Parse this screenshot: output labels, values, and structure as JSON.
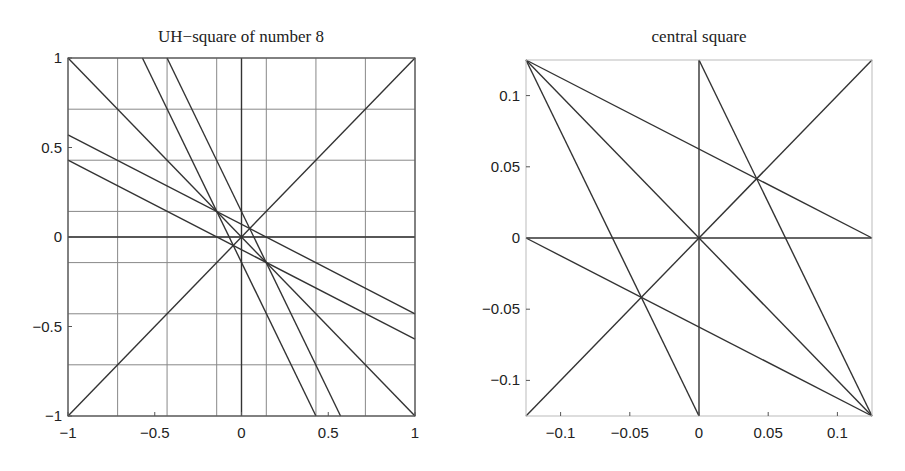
{
  "chart_data": [
    {
      "type": "line",
      "title": "UH−square of number 8",
      "xlabel": "",
      "ylabel": "",
      "xlim": [
        -1,
        1
      ],
      "ylim": [
        -1,
        1
      ],
      "grid": true,
      "grid_values": [
        -1,
        -0.714,
        -0.429,
        -0.143,
        0,
        0.143,
        0.429,
        0.714,
        1
      ],
      "xticks": [
        -1,
        -0.5,
        0,
        0.5,
        1
      ],
      "xtick_labels": [
        "−1",
        "−0.5",
        "0",
        "0.5",
        "1"
      ],
      "yticks": [
        1,
        0.5,
        0,
        -0.5,
        -1
      ],
      "ytick_labels": [
        "1",
        "0.5",
        "0",
        "−0.5",
        "−1"
      ],
      "series": [
        {
          "name": "diagonal y=x",
          "x": [
            -1,
            1
          ],
          "y": [
            -1,
            1
          ]
        },
        {
          "name": "anti-diagonal y=-x",
          "x": [
            -1,
            1
          ],
          "y": [
            1,
            -1
          ]
        },
        {
          "name": "horizontal y=0",
          "x": [
            -1,
            1
          ],
          "y": [
            0,
            0
          ]
        },
        {
          "name": "vertical x=0",
          "x": [
            0,
            0
          ],
          "y": [
            -1,
            1
          ]
        },
        {
          "name": "shallow upper",
          "x": [
            -1,
            1
          ],
          "y": [
            0.571,
            -0.429
          ]
        },
        {
          "name": "shallow lower",
          "x": [
            -1,
            1
          ],
          "y": [
            0.429,
            -0.571
          ]
        },
        {
          "name": "steep left",
          "x": [
            -0.571,
            0.429
          ],
          "y": [
            1,
            -1
          ]
        },
        {
          "name": "steep right",
          "x": [
            -0.429,
            0.571
          ],
          "y": [
            1,
            -1
          ]
        }
      ]
    },
    {
      "type": "line",
      "title": "central square",
      "xlabel": "",
      "ylabel": "",
      "xlim": [
        -0.125,
        0.125
      ],
      "ylim": [
        -0.125,
        0.125
      ],
      "grid": false,
      "xticks": [
        -0.1,
        -0.05,
        0,
        0.05,
        0.1
      ],
      "xtick_labels": [
        "−0.1",
        "−0.05",
        "0",
        "0.05",
        "0.1"
      ],
      "yticks": [
        0.1,
        0.05,
        0,
        -0.05,
        -0.1
      ],
      "ytick_labels": [
        "0.1",
        "0.05",
        "0",
        "−0.05",
        "−0.1"
      ],
      "series": [
        {
          "name": "diagonal y=x",
          "x": [
            -0.125,
            0.125
          ],
          "y": [
            -0.125,
            0.125
          ]
        },
        {
          "name": "anti-diagonal y=-x",
          "x": [
            -0.125,
            0.125
          ],
          "y": [
            0.125,
            -0.125
          ]
        },
        {
          "name": "horizontal y=0",
          "x": [
            -0.125,
            0.125
          ],
          "y": [
            0,
            0
          ]
        },
        {
          "name": "vertical x=0",
          "x": [
            0,
            0
          ],
          "y": [
            -0.125,
            0.125
          ]
        },
        {
          "name": "top-left to right-middle",
          "x": [
            -0.125,
            0.125
          ],
          "y": [
            0.125,
            0
          ]
        },
        {
          "name": "left-middle to bottom-right",
          "x": [
            -0.125,
            0.125
          ],
          "y": [
            0,
            -0.125
          ]
        },
        {
          "name": "top-left to bottom-center",
          "x": [
            -0.125,
            0
          ],
          "y": [
            0.125,
            -0.125
          ]
        },
        {
          "name": "top-center to bottom-right",
          "x": [
            0,
            0.125
          ],
          "y": [
            0.125,
            -0.125
          ]
        }
      ]
    }
  ]
}
